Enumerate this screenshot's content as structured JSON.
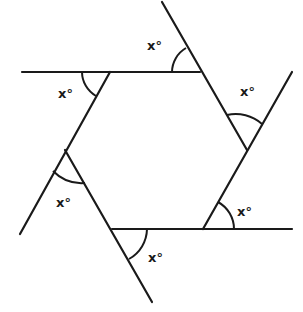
{
  "diagram": {
    "type": "geometry",
    "shape": "hexagon with extended sides",
    "colors": {
      "stroke": "#1a1a1a",
      "background": "#ffffff"
    },
    "lines": [
      {
        "id": "top",
        "x1": 22,
        "y1": 72,
        "x2": 200,
        "y2": 72
      },
      {
        "id": "right-upper",
        "x1": 162,
        "y1": 2,
        "x2": 247,
        "y2": 150
      },
      {
        "id": "right-lower",
        "x1": 292,
        "y1": 72,
        "x2": 203,
        "y2": 229
      },
      {
        "id": "bottom",
        "x1": 112,
        "y1": 229,
        "x2": 292,
        "y2": 229
      },
      {
        "id": "left-lower",
        "x1": 65,
        "y1": 150,
        "x2": 152,
        "y2": 302
      },
      {
        "id": "left-upper",
        "x1": 110,
        "y1": 72,
        "x2": 20,
        "y2": 234
      }
    ],
    "angle_labels": [
      {
        "text": "x°",
        "x": 147,
        "y": 50
      },
      {
        "text": "x°",
        "x": 58,
        "y": 98
      },
      {
        "text": "x°",
        "x": 240,
        "y": 96
      },
      {
        "text": "x°",
        "x": 237,
        "y": 216
      },
      {
        "text": "x°",
        "x": 148,
        "y": 262
      },
      {
        "text": "x°",
        "x": 56,
        "y": 207
      }
    ]
  }
}
